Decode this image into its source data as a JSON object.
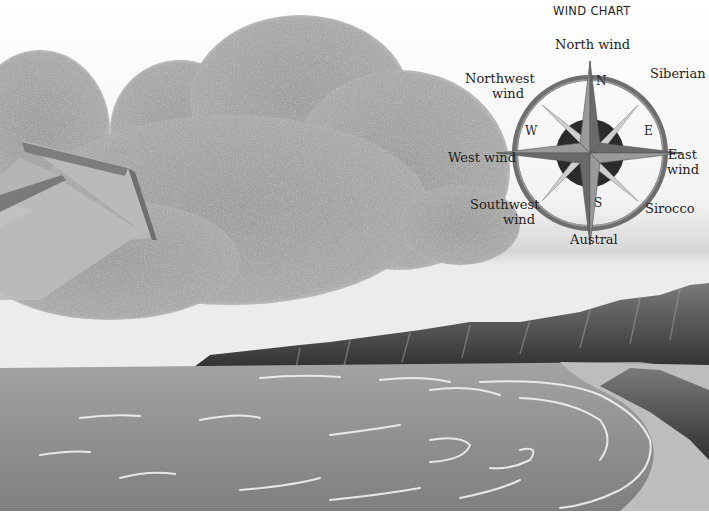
{
  "chart": {
    "title": "WIND CHART",
    "cardinals": {
      "n": "N",
      "e": "E",
      "s": "S",
      "w": "W"
    },
    "winds": {
      "north": "North wind",
      "northeast": "Siberian",
      "east_line1": "East",
      "east_line2": "wind",
      "southeast": "Sirocco",
      "south": "Austral",
      "southwest_line1": "Southwest",
      "southwest_line2": "wind",
      "west": "West wind",
      "northwest_line1": "Northwest",
      "northwest_line2": "wind"
    }
  },
  "scene": {
    "elements": [
      "cloud",
      "wind-arrow",
      "sea",
      "cliffs",
      "beach"
    ],
    "colors": {
      "sky": "#f4f4f4",
      "cloud": "#a6a6a6",
      "arrow": "#b8b8b8",
      "sea": "#8e8e8e",
      "cliff": "#4a4a4a",
      "sand": "#b9b9b9",
      "compass_ring": "#6e6e6e",
      "compass_center": "#2b2b2b"
    }
  }
}
